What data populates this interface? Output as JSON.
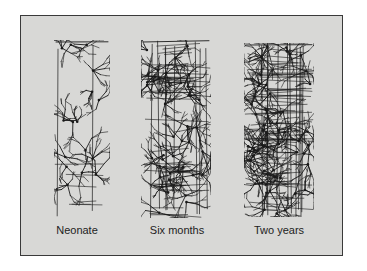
{
  "figure": {
    "background_color": "#d8d8d6",
    "border_color": "#3a3a3a",
    "ink_color": "#1a1a1a",
    "panels": [
      {
        "label": "Neonate",
        "density": "sparse"
      },
      {
        "label": "Six months",
        "density": "dense"
      },
      {
        "label": "Two years",
        "density": "very dense"
      }
    ]
  }
}
